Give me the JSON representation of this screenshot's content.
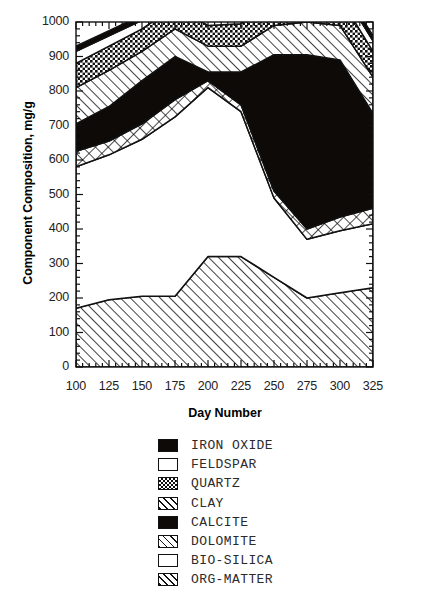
{
  "chart_data": {
    "type": "area",
    "title": "",
    "xlabel": "Day Number",
    "ylabel": "Component Composition, mg/g",
    "xlim": [
      100,
      325
    ],
    "ylim": [
      0,
      1000
    ],
    "grid": false,
    "stacked": true,
    "legend_position": "below",
    "x": [
      100,
      125,
      150,
      175,
      200,
      225,
      250,
      275,
      300,
      325
    ],
    "xticks": [
      "100",
      "125",
      "150",
      "175",
      "200",
      "225",
      "250",
      "275",
      "300",
      "325"
    ],
    "yticks": [
      "0",
      "100",
      "200",
      "300",
      "400",
      "500",
      "600",
      "700",
      "800",
      "900",
      "1000"
    ],
    "series": [
      {
        "name": "ORG-MATTER",
        "pattern": "diagonal-hatch",
        "values": [
          170,
          195,
          205,
          205,
          320,
          320,
          260,
          200,
          215,
          230
        ]
      },
      {
        "name": "BIO-SILICA",
        "pattern": "solid-white",
        "values": [
          410,
          420,
          455,
          520,
          490,
          420,
          230,
          170,
          180,
          185
        ]
      },
      {
        "name": "DOLOMITE",
        "pattern": "cross-diamond",
        "values": [
          45,
          40,
          45,
          50,
          20,
          20,
          20,
          30,
          40,
          45
        ]
      },
      {
        "name": "CALCITE",
        "pattern": "solid-black",
        "values": [
          80,
          100,
          125,
          125,
          25,
          95,
          395,
          505,
          455,
          275
        ]
      },
      {
        "name": "CLAY",
        "pattern": "diagonal-hatch",
        "values": [
          105,
          105,
          85,
          80,
          75,
          75,
          85,
          95,
          100,
          105
        ]
      },
      {
        "name": "QUARTZ",
        "pattern": "checker",
        "values": [
          70,
          70,
          65,
          65,
          60,
          65,
          75,
          80,
          80,
          75
        ]
      },
      {
        "name": "FELDSPAR",
        "pattern": "solid-white",
        "values": [
          35,
          30,
          25,
          20,
          15,
          15,
          20,
          25,
          30,
          30
        ]
      },
      {
        "name": "IRON OXIDE",
        "pattern": "solid-black",
        "values": [
          15,
          15,
          15,
          15,
          15,
          15,
          15,
          15,
          15,
          15
        ]
      }
    ],
    "legend_order": [
      "IRON OXIDE",
      "FELDSPAR",
      "QUARTZ",
      "CLAY",
      "CALCITE",
      "DOLOMITE",
      "BIO-SILICA",
      "ORG-MATTER"
    ]
  },
  "legend": {
    "items": [
      {
        "label": "IRON OXIDE",
        "pattern": "solid-black"
      },
      {
        "label": "FELDSPAR",
        "pattern": "solid-white"
      },
      {
        "label": "QUARTZ",
        "pattern": "checker"
      },
      {
        "label": "CLAY",
        "pattern": "diagonal-hatch"
      },
      {
        "label": "CALCITE",
        "pattern": "solid-black"
      },
      {
        "label": "DOLOMITE",
        "pattern": "cross-diamond"
      },
      {
        "label": "BIO-SILICA",
        "pattern": "solid-white"
      },
      {
        "label": "ORG-MATTER",
        "pattern": "diagonal-hatch"
      }
    ]
  },
  "colors": {
    "ink": "#000000",
    "background": "#ffffff",
    "tick_text": "#222222",
    "legend_text": "#2b2b2b"
  }
}
